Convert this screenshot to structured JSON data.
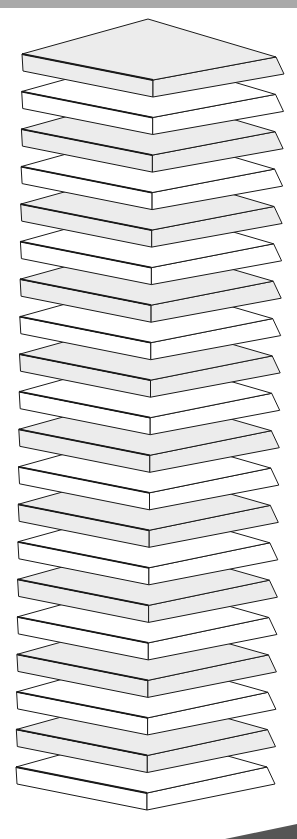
{
  "illustration": {
    "subject": "stack of flat slabs",
    "slab_count": 20,
    "colors": {
      "top_strip": "#a9a9a9",
      "outline": "#1a1a1a",
      "face_shaded": "#ececec",
      "face_white": "#ffffff",
      "swoosh": "#555555"
    },
    "geometry": {
      "first_left_corner": [
        22,
        54
      ],
      "last_left_corner": [
        16,
        767
      ],
      "first_right_corner": [
        276,
        57
      ],
      "last_right_corner": [
        267,
        767
      ],
      "first_top_vertex": [
        148,
        19
      ],
      "first_front_vertex": [
        153,
        80
      ],
      "thickness": 17,
      "bevel": 8
    }
  }
}
